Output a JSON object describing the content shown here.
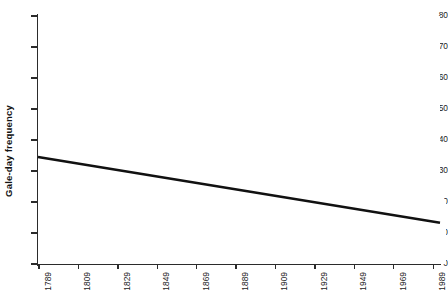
{
  "chart_data": {
    "type": "bar",
    "title": "",
    "xlabel": "",
    "ylabel": "Gale-day frequency",
    "ylim": [
      0,
      80
    ],
    "ytick_values": [
      0,
      10,
      20,
      30,
      40,
      50,
      60,
      70,
      80
    ],
    "ytick_labels": [
      "0",
      "10",
      "20",
      "30",
      "40",
      "50",
      "60",
      "70",
      "80"
    ],
    "xlim": [
      1789,
      1992
    ],
    "xtick_values": [
      1789,
      1809,
      1829,
      1849,
      1869,
      1889,
      1909,
      1929,
      1949,
      1969,
      1989
    ],
    "xtick_labels": [
      "1789",
      "1809",
      "1829",
      "1849",
      "1869",
      "1889",
      "1909",
      "1929",
      "1949",
      "1969",
      "1989"
    ],
    "grid": false,
    "legend": null,
    "bar_color": "#d7d7d7",
    "axis_color": "#2b2b2b",
    "trendline": {
      "type": "linear",
      "color": "#111111",
      "width_px": 2.4,
      "x_start": 1789,
      "y_start": 34.5,
      "x_end": 1992,
      "y_end": 13.3
    },
    "x": [
      1789,
      1790,
      1791,
      1792,
      1793,
      1794,
      1795,
      1796,
      1797,
      1798,
      1799,
      1800,
      1801,
      1802,
      1803,
      1804,
      1805,
      1806,
      1807,
      1808,
      1809,
      1810,
      1811,
      1812,
      1813,
      1814,
      1815,
      1816,
      1817,
      1818,
      1819,
      1820,
      1821,
      1822,
      1823,
      1824,
      1825,
      1826,
      1827,
      1828,
      1829,
      1830,
      1831,
      1832,
      1833,
      1834,
      1835,
      1836,
      1837,
      1838,
      1839,
      1840,
      1841,
      1842,
      1843,
      1844,
      1845,
      1846,
      1847,
      1848,
      1849,
      1850,
      1851,
      1852,
      1853,
      1854,
      1855,
      1856,
      1857,
      1858,
      1859,
      1860,
      1861,
      1862,
      1863,
      1864,
      1865,
      1866,
      1867,
      1868,
      1869,
      1870,
      1871,
      1872,
      1873,
      1874,
      1875,
      1876,
      1877,
      1878,
      1879,
      1880,
      1881,
      1882,
      1883,
      1884,
      1885,
      1886,
      1887,
      1888,
      1889,
      1890,
      1891,
      1892,
      1893,
      1894,
      1895,
      1896,
      1897,
      1898,
      1899,
      1900,
      1901,
      1902,
      1903,
      1904,
      1905,
      1906,
      1907,
      1908,
      1909,
      1910,
      1911,
      1912,
      1913,
      1914,
      1915,
      1916,
      1917,
      1918,
      1919,
      1920,
      1921,
      1922,
      1923,
      1924,
      1925,
      1926,
      1927,
      1928,
      1929,
      1930,
      1931,
      1932,
      1933,
      1934,
      1935,
      1936,
      1937,
      1938,
      1939,
      1940,
      1941,
      1942,
      1943,
      1944,
      1945,
      1946,
      1947,
      1948,
      1949,
      1950,
      1951,
      1952,
      1953,
      1954,
      1955,
      1956,
      1957,
      1958,
      1959,
      1960,
      1961,
      1962,
      1963,
      1964,
      1965,
      1966,
      1967,
      1968,
      1969,
      1970,
      1971,
      1972,
      1973,
      1974,
      1975,
      1976,
      1977,
      1978,
      1979,
      1980,
      1981,
      1982,
      1983,
      1984,
      1985,
      1986,
      1987,
      1988,
      1989,
      1990,
      1991,
      1992
    ],
    "values": [
      30,
      31,
      26,
      25,
      24,
      26,
      24,
      21,
      18,
      17,
      19,
      40,
      25,
      25,
      24,
      27,
      31,
      30,
      30,
      26,
      33,
      29,
      37,
      41,
      44,
      46,
      43,
      40,
      42,
      38,
      57,
      79,
      67,
      57,
      56,
      45,
      41,
      33,
      31,
      36,
      36,
      51,
      46,
      40,
      37,
      31,
      28,
      24,
      22,
      24,
      24,
      22,
      27,
      29,
      33,
      41,
      38,
      42,
      23,
      33,
      29,
      22,
      27,
      21,
      33,
      26,
      24,
      27,
      40,
      44,
      42,
      45,
      44,
      37,
      36,
      30,
      27,
      27,
      31,
      29,
      24,
      20,
      21,
      26,
      24,
      30,
      27,
      35,
      23,
      29,
      26,
      24,
      34,
      38,
      42,
      45,
      49,
      57,
      68,
      44,
      37,
      33,
      30,
      36,
      28,
      29,
      27,
      33,
      24,
      32,
      27,
      24,
      30,
      34,
      33,
      31,
      30,
      25,
      27,
      23,
      31,
      41,
      39,
      42,
      33,
      28,
      21,
      23,
      33,
      19,
      24,
      22,
      29,
      25,
      26,
      17,
      22,
      25,
      19,
      22,
      28,
      27,
      30,
      44,
      38,
      43,
      36,
      28,
      31,
      26,
      24,
      20,
      23,
      19,
      24,
      20,
      16,
      15,
      14,
      12,
      14,
      12,
      13,
      16,
      14,
      18,
      17,
      19,
      22,
      31,
      19,
      22,
      17,
      16,
      14,
      12,
      13,
      16,
      14,
      12,
      17,
      20,
      18,
      16,
      18,
      14,
      30,
      23,
      24,
      41,
      39,
      42,
      55,
      35,
      28,
      25,
      22,
      31,
      26,
      24,
      34,
      26,
      27,
      21
    ]
  }
}
